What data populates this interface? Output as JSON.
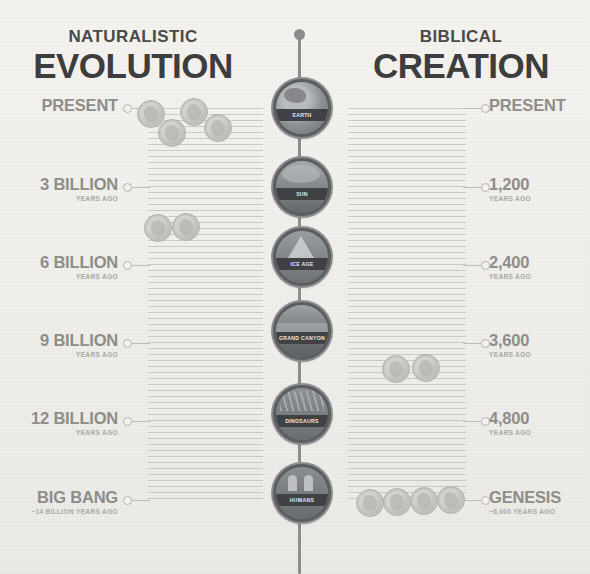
{
  "canvas": {
    "width": 590,
    "height": 574,
    "background": "#f2f1ee"
  },
  "headings": {
    "left": {
      "kicker": "NATURALISTIC",
      "title": "EVOLUTION"
    },
    "right": {
      "kicker": "BIBLICAL",
      "title": "CREATION"
    }
  },
  "colors": {
    "ink": "#3d3d3d",
    "kicker": "#4a4a4a",
    "label": "#8e8d89",
    "sublabel": "#a9a8a4",
    "hatch": "#c9c8c4",
    "spine": "#8d8d8d",
    "medallion_ring": "#5b5d60",
    "medallion_caption_bg": "#3f4144"
  },
  "chart_data": {
    "type": "timeline",
    "orientation": "vertical-dual-axis",
    "note": "Two parallel time axes share the same vertical pixel scale; the left axis spans billions of years while the right axis spans thousands of years.",
    "axes": [
      {
        "name": "Naturalistic Evolution",
        "side": "left",
        "unit": "years ago",
        "ticks": [
          {
            "label": "PRESENT",
            "sublabel": "",
            "value": 0,
            "y": 108
          },
          {
            "label": "3 BILLION",
            "sublabel": "YEARS AGO",
            "value": 3000000000,
            "y": 187
          },
          {
            "label": "6 BILLION",
            "sublabel": "YEARS AGO",
            "value": 6000000000,
            "y": 265
          },
          {
            "label": "9 BILLION",
            "sublabel": "YEARS AGO",
            "value": 9000000000,
            "y": 343
          },
          {
            "label": "12 BILLION",
            "sublabel": "YEARS AGO",
            "value": 12000000000,
            "y": 421
          },
          {
            "label": "BIG BANG",
            "sublabel": "~14 BILLION YEARS AGO",
            "value": 14000000000,
            "y": 500
          }
        ]
      },
      {
        "name": "Biblical Creation",
        "side": "right",
        "unit": "years ago",
        "ticks": [
          {
            "label": "PRESENT",
            "sublabel": "",
            "value": 0,
            "y": 108
          },
          {
            "label": "1,200",
            "sublabel": "YEARS AGO",
            "value": 1200,
            "y": 187
          },
          {
            "label": "2,400",
            "sublabel": "YEARS AGO",
            "value": 2400,
            "y": 265
          },
          {
            "label": "3,600",
            "sublabel": "YEARS AGO",
            "value": 3600,
            "y": 343
          },
          {
            "label": "4,800",
            "sublabel": "YEARS AGO",
            "value": 4800,
            "y": 421
          },
          {
            "label": "GENESIS",
            "sublabel": "~6,000 YEARS AGO",
            "value": 6000,
            "y": 500
          }
        ]
      }
    ],
    "milestones": [
      {
        "label": "EARTH",
        "y": 105
      },
      {
        "label": "SUN",
        "y": 184
      },
      {
        "label": "ICE AGE",
        "y": 254
      },
      {
        "label": "GRAND CANYON",
        "y": 328
      },
      {
        "label": "DINOSAURS",
        "y": 411
      },
      {
        "label": "HUMANS",
        "y": 490
      }
    ],
    "coin_clusters": [
      {
        "axis": "left",
        "near": "PRESENT",
        "count": 4
      },
      {
        "axis": "left",
        "near": "3 BILLION",
        "count": 2
      },
      {
        "axis": "right",
        "near": "3,600",
        "count": 2
      },
      {
        "axis": "right",
        "near": "GENESIS",
        "count": 4
      }
    ]
  },
  "medallions": [
    {
      "name": "earth-medallion",
      "label": "EARTH",
      "art": "art-earth",
      "top": 79,
      "left": 273
    },
    {
      "name": "sun-medallion",
      "label": "SUN",
      "art": "art-sun",
      "top": 158,
      "left": 273
    },
    {
      "name": "ice-age-medallion",
      "label": "ICE AGE",
      "art": "art-ice",
      "top": 228,
      "left": 273
    },
    {
      "name": "grand-canyon-medallion",
      "label": "GRAND CANYON",
      "art": "art-canyon",
      "top": 302,
      "left": 273
    },
    {
      "name": "dinosaurs-medallion",
      "label": "DINOSAURS",
      "art": "art-dino",
      "top": 385,
      "left": 273
    },
    {
      "name": "humans-medallion",
      "label": "HUMANS",
      "art": "art-humans",
      "top": 464,
      "left": 273
    }
  ],
  "left_ticks": [
    {
      "label": "PRESENT",
      "sublabel": "",
      "y": 108,
      "lead": 18
    },
    {
      "label": "3 BILLION",
      "sublabel": "YEARS AGO",
      "y": 187,
      "lead": 18
    },
    {
      "label": "6 BILLION",
      "sublabel": "YEARS AGO",
      "y": 265,
      "lead": 18
    },
    {
      "label": "9 BILLION",
      "sublabel": "YEARS AGO",
      "y": 343,
      "lead": 18
    },
    {
      "label": "12 BILLION",
      "sublabel": "YEARS AGO",
      "y": 421,
      "lead": 18
    },
    {
      "label": "BIG BANG",
      "sublabel": "~14 BILLION YEARS AGO",
      "y": 500,
      "lead": 18
    }
  ],
  "right_ticks": [
    {
      "label": "PRESENT",
      "sublabel": "",
      "y": 108,
      "lead": 18
    },
    {
      "label": "1,200",
      "sublabel": "YEARS AGO",
      "y": 187,
      "lead": 18
    },
    {
      "label": "2,400",
      "sublabel": "YEARS AGO",
      "y": 265,
      "lead": 18
    },
    {
      "label": "3,600",
      "sublabel": "YEARS AGO",
      "y": 343,
      "lead": 18
    },
    {
      "label": "4,800",
      "sublabel": "YEARS AGO",
      "y": 421,
      "lead": 18
    },
    {
      "label": "GENESIS",
      "sublabel": "~6,000 YEARS AGO",
      "y": 500,
      "lead": 18
    }
  ],
  "coins": [
    {
      "name": "coin-evolution-1",
      "left": 137,
      "top": 100,
      "size": 26
    },
    {
      "name": "coin-evolution-2",
      "left": 180,
      "top": 98,
      "size": 26
    },
    {
      "name": "coin-evolution-3",
      "left": 158,
      "top": 119,
      "size": 26
    },
    {
      "name": "coin-evolution-4",
      "left": 204,
      "top": 114,
      "size": 26
    },
    {
      "name": "coin-evolution-5",
      "left": 144,
      "top": 214,
      "size": 26
    },
    {
      "name": "coin-evolution-6",
      "left": 172,
      "top": 213,
      "size": 26
    },
    {
      "name": "coin-creation-1",
      "left": 382,
      "top": 355,
      "size": 26
    },
    {
      "name": "coin-creation-2",
      "left": 412,
      "top": 354,
      "size": 26
    },
    {
      "name": "coin-creation-3",
      "left": 356,
      "top": 489,
      "size": 26
    },
    {
      "name": "coin-creation-4",
      "left": 383,
      "top": 488,
      "size": 26
    },
    {
      "name": "coin-creation-5",
      "left": 410,
      "top": 487,
      "size": 26
    },
    {
      "name": "coin-creation-6",
      "left": 437,
      "top": 486,
      "size": 26
    }
  ],
  "hatch_groups": [
    {
      "name": "hatch-left",
      "left": 148,
      "top": 108,
      "width": 115,
      "rows": 66
    },
    {
      "name": "hatch-right",
      "left": 348,
      "top": 108,
      "width": 118,
      "rows": 66
    }
  ]
}
